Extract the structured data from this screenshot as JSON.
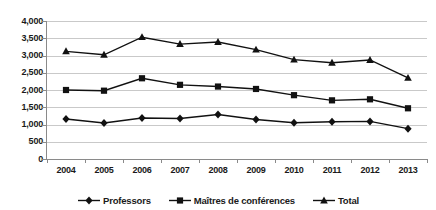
{
  "chart_data": {
    "type": "line",
    "title": "",
    "xlabel": "",
    "ylabel": "",
    "categories": [
      "2004",
      "2005",
      "2006",
      "2007",
      "2008",
      "2009",
      "2010",
      "2011",
      "2012",
      "2013"
    ],
    "ylim": [
      0,
      4000
    ],
    "ytick_labels": [
      "0",
      "500",
      "1,000",
      "1,500",
      "2,000",
      "2,500",
      "3,000",
      "3,500",
      "4,000"
    ],
    "ytick_values": [
      0,
      500,
      1000,
      1500,
      2000,
      2500,
      3000,
      3500,
      4000
    ],
    "grid": true,
    "legend_position": "bottom",
    "series": [
      {
        "name": "Professors",
        "marker": "diamond",
        "color": "#111111",
        "values": [
          1160,
          1045,
          1190,
          1175,
          1290,
          1145,
          1050,
          1080,
          1090,
          880
        ]
      },
      {
        "name": "Maîtres de conférences",
        "marker": "square",
        "color": "#111111",
        "values": [
          2000,
          1980,
          2340,
          2150,
          2100,
          2030,
          1850,
          1700,
          1730,
          1470
        ]
      },
      {
        "name": "Total",
        "marker": "triangle",
        "color": "#111111",
        "values": [
          3120,
          3020,
          3530,
          3330,
          3390,
          3170,
          2880,
          2790,
          2870,
          2350
        ]
      }
    ]
  }
}
